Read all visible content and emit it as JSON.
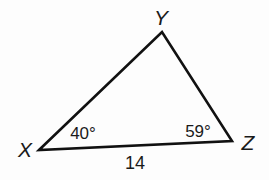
{
  "diagram": {
    "type": "triangle",
    "vertices": [
      {
        "label": "X",
        "x": 39,
        "y": 150
      },
      {
        "label": "Y",
        "x": 162,
        "y": 32
      },
      {
        "label": "Z",
        "x": 232,
        "y": 141
      }
    ],
    "angles": {
      "X": "40°",
      "Z": "59°"
    },
    "sides": {
      "XZ": "14"
    },
    "stroke_color": "#111111"
  }
}
